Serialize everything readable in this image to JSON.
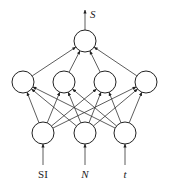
{
  "diagram": {
    "type": "neural-network",
    "output": {
      "label": "S",
      "x": 85,
      "y": 41
    },
    "hidden": [
      {
        "x": 23,
        "y": 82
      },
      {
        "x": 64,
        "y": 82
      },
      {
        "x": 105,
        "y": 82
      },
      {
        "x": 146,
        "y": 82
      }
    ],
    "inputs": [
      {
        "label": "SI",
        "x": 43,
        "y": 133,
        "italic": false
      },
      {
        "label": "N",
        "x": 85,
        "y": 133,
        "italic": true
      },
      {
        "label": "t",
        "x": 125,
        "y": 133,
        "italic": true
      }
    ],
    "node_radius": 11
  }
}
